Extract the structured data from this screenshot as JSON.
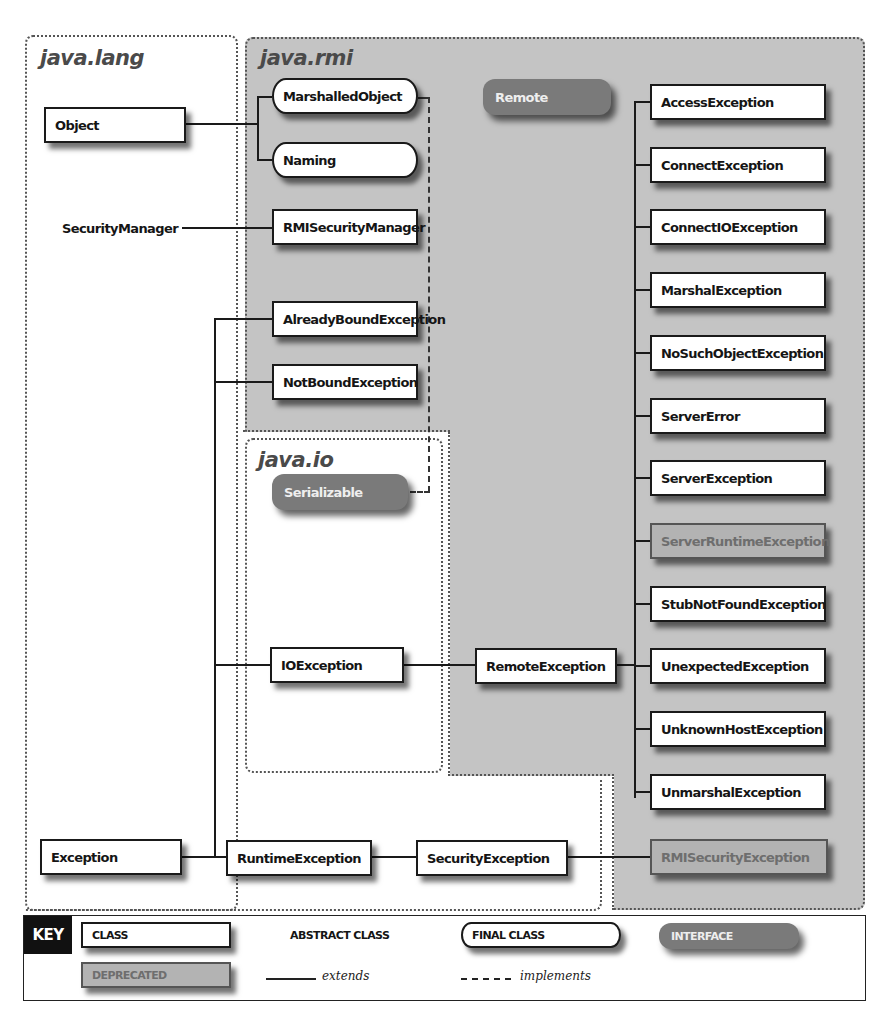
{
  "packages": {
    "java_lang": "java.lang",
    "java_rmi": "java.rmi",
    "java_io": "java.io"
  },
  "nodes": {
    "object": "Object",
    "security_manager": "SecurityManager",
    "exception": "Exception",
    "marshalled_object": "MarshalledObject",
    "naming": "Naming",
    "rmi_security_manager": "RMISecurityManager",
    "already_bound_exception": "AlreadyBoundException",
    "not_bound_exception": "NotBoundException",
    "remote": "Remote",
    "serializable": "Serializable",
    "io_exception": "IOException",
    "remote_exception": "RemoteException",
    "runtime_exception": "RuntimeException",
    "security_exception": "SecurityException",
    "rmi_security_exception": "RMISecurityException",
    "remote_subclasses": [
      {
        "label": "AccessException",
        "kind": "class"
      },
      {
        "label": "ConnectException",
        "kind": "class"
      },
      {
        "label": "ConnectIOException",
        "kind": "class"
      },
      {
        "label": "MarshalException",
        "kind": "class"
      },
      {
        "label": "NoSuchObjectException",
        "kind": "class"
      },
      {
        "label": "ServerError",
        "kind": "class"
      },
      {
        "label": "ServerException",
        "kind": "class"
      },
      {
        "label": "ServerRuntimeException",
        "kind": "deprecated"
      },
      {
        "label": "StubNotFoundException",
        "kind": "class"
      },
      {
        "label": "UnexpectedException",
        "kind": "class"
      },
      {
        "label": "UnknownHostException",
        "kind": "class"
      },
      {
        "label": "UnmarshalException",
        "kind": "class"
      }
    ]
  },
  "key": {
    "title": "KEY",
    "class": "CLASS",
    "abstract_class": "ABSTRACT CLASS",
    "final_class": "FINAL CLASS",
    "interface": "INTERFACE",
    "deprecated": "DEPRECATED",
    "extends": "extends",
    "implements": "implements"
  },
  "colors": {
    "rmi_background": "#c4c4c4",
    "interface_fill": "#7a7a7a",
    "deprecated_fill": "#b3b3b3"
  }
}
